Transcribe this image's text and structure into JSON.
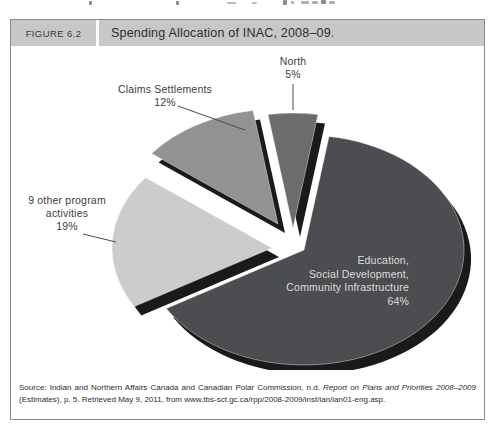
{
  "page": {
    "figure_label": "FIGURE 6.2",
    "title": "Spending Allocation of INAC, 2008–09."
  },
  "source": {
    "prefix": "Source: Indian and Northern Affairs Canada and Canadian Polar Commission, n.d. ",
    "italic": "Report on Plans and Priorities 2008–2009",
    "suffix": " (Estimates), p. 5. Retrieved May 9, 2011, from www.tbs-sct.gc.ca/rpp/2008-2009/inst/ian/ian01-eng.asp."
  },
  "chart_data": {
    "type": "pie",
    "title": "Spending Allocation of INAC, 2008–09.",
    "style": "exploded-3d",
    "start_angle_deg": 9,
    "legend_position": "outside-labels-with-leader-lines",
    "slices": [
      {
        "id": "education",
        "label": "Education, Social Development, Community Infrastructure",
        "value_pct": 64,
        "color": "#4c4d50",
        "label_placement": "inside",
        "label_lines": [
          "Education,",
          "Social Development,",
          "Community Infrastructure",
          "64%"
        ]
      },
      {
        "id": "other9",
        "label": "9 other program activities",
        "value_pct": 19,
        "color": "#cbccce",
        "label_placement": "outside",
        "label_lines": [
          "9 other program",
          "activities",
          "19%"
        ]
      },
      {
        "id": "claims",
        "label": "Claims Settlements",
        "value_pct": 12,
        "color": "#909294",
        "label_placement": "outside",
        "label_lines": [
          "Claims Settlements",
          "12%"
        ]
      },
      {
        "id": "north",
        "label": "North",
        "value_pct": 5,
        "color": "#6a6c6e",
        "label_placement": "outside",
        "label_lines": [
          "North",
          "5%"
        ]
      }
    ],
    "shadow_color": "#1a1a1a",
    "label_color": "#3c3d3f",
    "inside_label_color": "#dededd",
    "leader_color": "#4a4a4a"
  }
}
